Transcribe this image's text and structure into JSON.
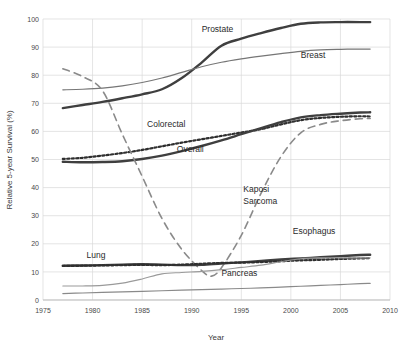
{
  "chart_data": {
    "type": "line",
    "title": "",
    "xlabel": "Year",
    "ylabel": "Relative 5-year Survival (%)",
    "xlim": [
      1975,
      2010
    ],
    "ylim": [
      0,
      100
    ],
    "xticks": [
      1975,
      1980,
      1985,
      1990,
      1995,
      2000,
      2005,
      2010
    ],
    "yticks": [
      0,
      10,
      20,
      30,
      40,
      50,
      60,
      70,
      80,
      90,
      100
    ],
    "grid": true,
    "legend_position": "inline-annotations",
    "series": [
      {
        "name": "Prostate",
        "style": "solid-thick",
        "color": "#3f3f3f",
        "label_x": 1992.0,
        "label_y": 95.5,
        "x": [
          1977,
          1979,
          1981,
          1983,
          1985,
          1987,
          1989,
          1991,
          1993,
          1995,
          1997,
          1999,
          2001,
          2003,
          2005,
          2007,
          2008
        ],
        "y": [
          68.3,
          69.4,
          70.5,
          71.8,
          73.2,
          75.0,
          79.0,
          84.5,
          90.5,
          93.0,
          95.0,
          96.8,
          98.3,
          98.8,
          98.9,
          98.9,
          98.9
        ]
      },
      {
        "name": "Breast",
        "style": "solid-thin",
        "color": "#767676",
        "label_x": 2001.2,
        "label_y": 86.0,
        "x": [
          1977,
          1979,
          1981,
          1983,
          1985,
          1987,
          1989,
          1991,
          1993,
          1995,
          1997,
          1999,
          2001,
          2003,
          2005,
          2007,
          2008
        ],
        "y": [
          74.8,
          75.0,
          75.4,
          76.2,
          77.4,
          79.0,
          81.0,
          83.0,
          84.6,
          85.8,
          86.8,
          87.7,
          88.5,
          89.0,
          89.2,
          89.3,
          89.3
        ]
      },
      {
        "name": "Colorectal",
        "style": "dotted",
        "color": "#2f2f2f",
        "label_x": 1986.0,
        "label_y": 62.0,
        "x": [
          1977,
          1979,
          1981,
          1983,
          1985,
          1987,
          1989,
          1991,
          1993,
          1995,
          1997,
          1999,
          2001,
          2003,
          2005,
          2007,
          2008
        ],
        "y": [
          50.2,
          50.6,
          51.4,
          52.3,
          53.4,
          54.7,
          56.0,
          57.2,
          58.4,
          59.6,
          60.8,
          62.5,
          64.0,
          64.8,
          65.2,
          65.4,
          65.3
        ]
      },
      {
        "name": "Overall",
        "style": "solid-thick",
        "color": "#3f3f3f",
        "label_x": 1989.0,
        "label_y": 53.0,
        "x": [
          1977,
          1979,
          1981,
          1983,
          1985,
          1987,
          1989,
          1991,
          1993,
          1995,
          1997,
          1999,
          2001,
          2003,
          2005,
          2007,
          2008
        ],
        "y": [
          49.2,
          49.0,
          49.1,
          49.4,
          50.2,
          51.4,
          53.0,
          54.8,
          56.8,
          59.0,
          61.2,
          63.3,
          65.0,
          65.8,
          66.3,
          66.7,
          66.8
        ]
      },
      {
        "name": "Kaposi Sarcoma",
        "style": "dashed",
        "color": "#8a8a8a",
        "label_x": 1995.0,
        "label_y": 37.0,
        "x": [
          1977,
          1979,
          1981,
          1983,
          1985,
          1987,
          1989,
          1991,
          1992,
          1993,
          1995,
          1997,
          1999,
          2001,
          2003,
          2005,
          2007,
          2008
        ],
        "y": [
          82.3,
          79.5,
          74.5,
          59.0,
          44.0,
          29.0,
          18.0,
          10.5,
          8.5,
          11.5,
          23.0,
          38.0,
          51.0,
          59.5,
          62.5,
          63.8,
          64.5,
          64.6
        ]
      },
      {
        "name": "Lung",
        "style": "solid-thick",
        "color": "#3f3f3f",
        "label_x": 1980.0,
        "label_y": 15.2,
        "x": [
          1977,
          1979,
          1981,
          1983,
          1985,
          1987,
          1989,
          1991,
          1993,
          1995,
          1997,
          1999,
          2001,
          2003,
          2005,
          2007,
          2008
        ],
        "y": [
          12.2,
          12.3,
          12.4,
          12.6,
          12.7,
          12.6,
          12.4,
          12.5,
          13.0,
          13.4,
          13.9,
          14.4,
          14.8,
          15.2,
          15.6,
          16.0,
          16.1
        ]
      },
      {
        "name": "Esophagus",
        "style": "dotted",
        "color": "#2f2f2f",
        "label_x": 2000.5,
        "label_y": 23.5,
        "x": [
          1977,
          1979,
          1981,
          1983,
          1985,
          1987,
          1989,
          1991,
          1993,
          1995,
          1997,
          1999,
          2001,
          2003,
          2005,
          2007,
          2008
        ],
        "y": [
          12.1,
          12.2,
          12.3,
          12.4,
          12.5,
          12.4,
          12.6,
          12.9,
          13.2,
          13.3,
          13.5,
          13.8,
          14.1,
          14.3,
          14.6,
          14.8,
          14.9
        ]
      },
      {
        "name": "Pancreas",
        "style": "solid-thin",
        "color": "#8a8a8a",
        "label_x": 1993.0,
        "label_y": 8.2,
        "x": [
          1977,
          1979,
          1981,
          1983,
          1985,
          1987,
          1989,
          1991,
          1993,
          1995,
          1997,
          1999,
          2001,
          2003,
          2005,
          2007,
          2008
        ],
        "y": [
          2.3,
          2.5,
          2.7,
          2.9,
          3.1,
          3.3,
          3.5,
          3.7,
          3.9,
          4.1,
          4.3,
          4.6,
          4.9,
          5.2,
          5.5,
          5.8,
          5.9
        ]
      },
      {
        "name": "Esophagus-light",
        "style": "solid-thin-light",
        "color": "#9a9a9a",
        "label_x": null,
        "label_y": null,
        "x": [
          1977,
          1979,
          1981,
          1983,
          1985,
          1987,
          1989,
          1991,
          1993,
          1995,
          1997,
          1999,
          2001,
          2003,
          2005,
          2007,
          2008
        ],
        "y": [
          5.0,
          5.0,
          5.2,
          6.0,
          7.5,
          9.3,
          9.8,
          10.2,
          10.8,
          11.6,
          12.4,
          13.6,
          14.7,
          15.0,
          15.0,
          15.0,
          15.0
        ]
      }
    ]
  },
  "labels": {
    "prostate": "Prostate",
    "breast": "Breast",
    "colorectal": "Colorectal",
    "overall": "Overall",
    "kaposi_line1": "Kaposi",
    "kaposi_line2": "Sarcoma",
    "lung": "Lung",
    "esophagus": "Esophagus",
    "pancreas": "Pancreas"
  },
  "axes": {
    "x_title": "Year",
    "y_title": "Relative 5-year Survival (%)",
    "x_ticks": [
      "1975",
      "1980",
      "1985",
      "1990",
      "1995",
      "2000",
      "2005",
      "2010"
    ],
    "y_ticks": [
      "100",
      "90",
      "80",
      "70",
      "60",
      "50",
      "40",
      "30",
      "20",
      "10",
      "0"
    ]
  },
  "colors": {
    "grid": "#d9d9d9",
    "dark_line": "#3f3f3f",
    "mid_line": "#767676",
    "light_line": "#9a9a9a",
    "text": "#3a3a3a"
  }
}
